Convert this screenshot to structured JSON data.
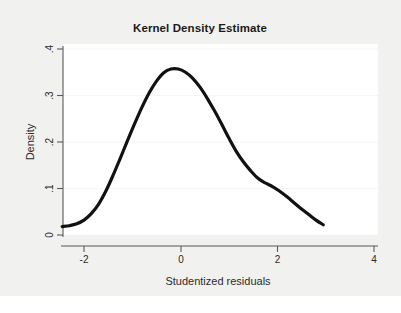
{
  "chart_data": {
    "type": "line",
    "title": "Kernel Density Estimate",
    "xlabel": "Studentized residuals",
    "ylabel": "Density",
    "xlim": [
      -2.6,
      4.3
    ],
    "ylim": [
      0,
      0.41
    ],
    "xticks": [
      -2,
      0,
      2,
      4
    ],
    "xtick_labels": [
      "-2",
      "0",
      "2",
      "4"
    ],
    "yticks": [
      0,
      0.1,
      0.2,
      0.3,
      0.4
    ],
    "ytick_labels": [
      "0",
      ".1",
      ".2",
      ".3",
      ".4"
    ],
    "grid": true,
    "legend": "none",
    "series": [
      {
        "name": "Density",
        "x": [
          -2.45,
          -2.3,
          -2.15,
          -2.0,
          -1.85,
          -1.7,
          -1.55,
          -1.4,
          -1.25,
          -1.1,
          -0.95,
          -0.8,
          -0.65,
          -0.5,
          -0.35,
          -0.2,
          -0.05,
          0.1,
          0.25,
          0.4,
          0.55,
          0.7,
          0.85,
          1.0,
          1.15,
          1.3,
          1.45,
          1.6,
          1.75,
          1.9,
          2.05,
          2.2,
          2.35,
          2.5,
          2.65,
          2.8,
          2.95
        ],
        "y": [
          0.018,
          0.02,
          0.024,
          0.032,
          0.046,
          0.066,
          0.094,
          0.128,
          0.165,
          0.203,
          0.24,
          0.275,
          0.306,
          0.331,
          0.349,
          0.357,
          0.357,
          0.35,
          0.337,
          0.318,
          0.294,
          0.267,
          0.238,
          0.208,
          0.18,
          0.157,
          0.138,
          0.122,
          0.112,
          0.104,
          0.094,
          0.082,
          0.069,
          0.056,
          0.044,
          0.032,
          0.022
        ]
      }
    ]
  },
  "figure": {
    "background_color": "#f1f1f0",
    "plot_background_color": "#ffffff",
    "curve_color": "#111111",
    "axis_color": "#5a5a5a"
  }
}
